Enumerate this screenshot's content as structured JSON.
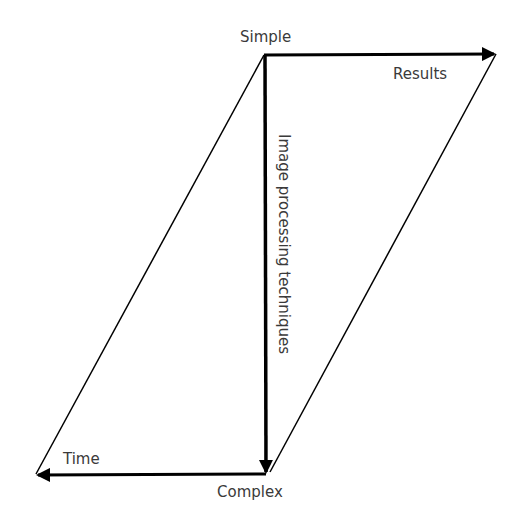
{
  "diagram": {
    "labels": {
      "top": "Simple",
      "bottom": "Complex",
      "right_arrow": "Results",
      "left_arrow": "Time",
      "vertical_arrow": "Image processing techniques"
    },
    "colors": {
      "line": "#000000",
      "text": "#3a3a3a",
      "background": "#ffffff"
    }
  }
}
